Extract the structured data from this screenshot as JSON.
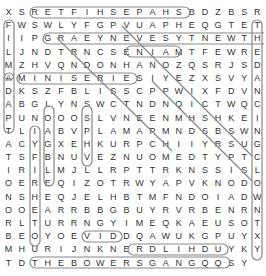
{
  "puzzle": {
    "rows": [
      "XSRETFIHSEPAHSBDZBSR",
      "FWSWLYFGPVUAPHEQGTET",
      "IIPGRAEYNEVESYTNEWTH",
      "LJNDTRNCSENIAMTFEWRE",
      "MZHVQNDONHANOZQSRJSD",
      "AMINISERIESIYEZXSVYA",
      "DKSZFBLISSCPPWIXFDVN",
      "ABGLYNSWCTNDNQICTWQC",
      "PUNOOOSLVNEENMHSHKEI",
      "TLIABVPLAMAPMNDSBSWN",
      "ACYGXEHKURPCHIIYRSUG",
      "TSFBNUVEZNUOMEDTYPTC",
      "IRILMJLLRPTTRKNSSISL",
      "OEREQIZOTRWYAPVKNODO",
      "NSHEQJELHBTMFNDOIADW",
      "OOEARRBBGBUYRVRBENRN",
      "RLTURRNGYIMEQKAEUSOT",
      "BEOYOEVIDDQAWUKGPUYX",
      "MHURIJNKNERDLIHDUYK",
      "YTDTHEBOWERSGANGQQSY"
    ],
    "found_words": [
      {
        "word": "SHEPARD SHIELF",
        "note": "row0 cols2-14"
      },
      {
        "word": "MINISERIES",
        "row": 5
      },
      {
        "word": "THE BOWERS GANG",
        "row": 19
      },
      {
        "word": "EVIL",
        "row": 17
      },
      {
        "word": "NERD LIHD",
        "row": 18
      },
      {
        "word": "MAIN E",
        "row": 3
      },
      {
        "word": "GRAEYNEVESYTNEWT",
        "row": 2
      }
    ]
  }
}
